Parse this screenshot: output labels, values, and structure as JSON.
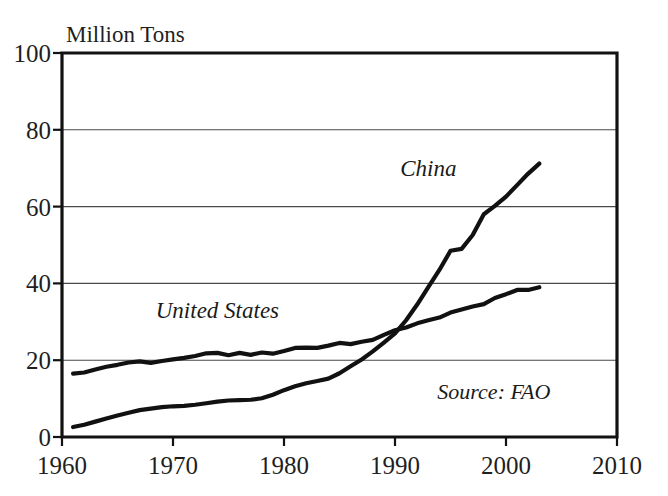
{
  "chart_data": {
    "type": "line",
    "title": "",
    "ylabel": "Million Tons",
    "xlabel": "",
    "ylim": [
      0,
      100
    ],
    "xlim": [
      1960,
      2010
    ],
    "yticks": [
      0,
      20,
      40,
      60,
      80,
      100
    ],
    "ytick_labels": [
      "0",
      "20",
      "40",
      "60",
      "80",
      "100"
    ],
    "xticks": [
      1960,
      1970,
      1980,
      1990,
      2000,
      2010
    ],
    "xtick_labels": [
      "1960",
      "1970",
      "1980",
      "1990",
      "2000",
      "2010"
    ],
    "grid": "horizontal",
    "legend": "inline-annotations",
    "annotations": [
      {
        "text": "China",
        "x": 1993,
        "y": 68
      },
      {
        "text": "United States",
        "x": 1974,
        "y": 31
      },
      {
        "text": "Source: FAO",
        "x": 2004,
        "y": 10
      }
    ],
    "series": [
      {
        "name": "China",
        "label": "China",
        "x": [
          1961,
          1962,
          1963,
          1964,
          1965,
          1966,
          1967,
          1968,
          1969,
          1970,
          1971,
          1972,
          1973,
          1974,
          1975,
          1976,
          1977,
          1978,
          1979,
          1980,
          1981,
          1982,
          1983,
          1984,
          1985,
          1986,
          1987,
          1988,
          1989,
          1990,
          1991,
          1992,
          1993,
          1994,
          1995,
          1996,
          1997,
          1998,
          1999,
          2000,
          2001,
          2002,
          2003
        ],
        "values": [
          2.6,
          3.2,
          4.0,
          4.8,
          5.6,
          6.3,
          7.0,
          7.4,
          7.8,
          8.0,
          8.1,
          8.4,
          8.8,
          9.2,
          9.5,
          9.6,
          9.7,
          10.1,
          11.0,
          12.2,
          13.2,
          14.0,
          14.6,
          15.2,
          16.6,
          18.4,
          20.2,
          22.3,
          24.6,
          27.0,
          30.4,
          34.5,
          39.0,
          43.5,
          48.5,
          49.0,
          52.6,
          58.0,
          60.2,
          62.6,
          65.6,
          68.6,
          71.2
        ]
      },
      {
        "name": "United States",
        "label": "United States",
        "x": [
          1961,
          1962,
          1963,
          1964,
          1965,
          1966,
          1967,
          1968,
          1969,
          1970,
          1971,
          1972,
          1973,
          1974,
          1975,
          1976,
          1977,
          1978,
          1979,
          1980,
          1981,
          1982,
          1983,
          1984,
          1985,
          1986,
          1987,
          1988,
          1989,
          1990,
          1991,
          1992,
          1993,
          1994,
          1995,
          1996,
          1997,
          1998,
          1999,
          2000,
          2001,
          2002,
          2003
        ],
        "values": [
          16.5,
          16.8,
          17.6,
          18.3,
          18.8,
          19.4,
          19.7,
          19.3,
          19.8,
          20.2,
          20.6,
          21.1,
          21.8,
          21.9,
          21.3,
          21.9,
          21.4,
          22.0,
          21.7,
          22.4,
          23.2,
          23.3,
          23.2,
          23.8,
          24.5,
          24.2,
          24.8,
          25.3,
          26.6,
          27.8,
          28.5,
          29.6,
          30.4,
          31.1,
          32.4,
          33.2,
          34.0,
          34.6,
          36.2,
          37.2,
          38.3,
          38.3,
          39.0
        ]
      }
    ]
  }
}
